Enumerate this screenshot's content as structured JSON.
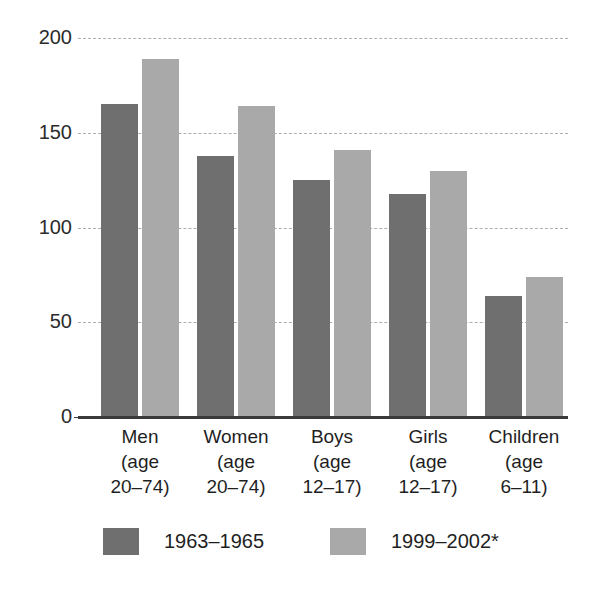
{
  "chart_data": {
    "type": "bar",
    "title": "",
    "subtitle": "",
    "xlabel": "",
    "ylabel": "",
    "ylim": [
      0,
      200
    ],
    "yticks": [
      0,
      50,
      100,
      150,
      200
    ],
    "ytick_labels": [
      "0",
      "50",
      "100",
      "150",
      "200"
    ],
    "grid": "horizontal-dashed",
    "legend_position": "bottom",
    "categories": [
      "Men\n(age\n20–74)",
      "Women\n(age\n20–74)",
      "Boys\n(age\n12–17)",
      "Girls\n(age\n12–17)",
      "Children\n(age\n6–11)"
    ],
    "series": [
      {
        "name": "1963–1965",
        "color": "#6f6f6f",
        "values": [
          166,
          139,
          126,
          119,
          65
        ]
      },
      {
        "name": "1999–2002*",
        "color": "#a9a9a9",
        "values": [
          190,
          165,
          142,
          131,
          75
        ]
      }
    ]
  },
  "legend": {
    "items": [
      {
        "label": "1963–1965",
        "color": "#6f6f6f"
      },
      {
        "label": "1999–2002*",
        "color": "#a9a9a9"
      }
    ]
  },
  "axis": {
    "baseline_color": "#3a3a3a",
    "gridline_color": "#aeaeae"
  }
}
